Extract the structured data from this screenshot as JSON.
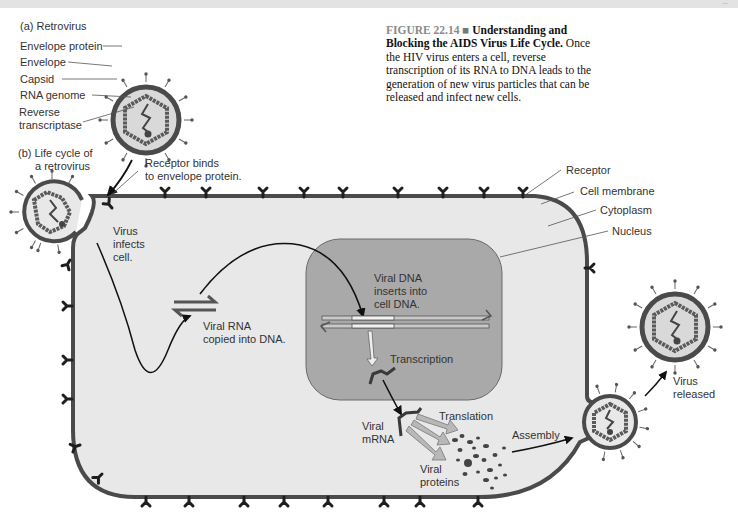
{
  "page": {
    "page_number": "..."
  },
  "caption": {
    "figure_number": "FIGURE 22.14",
    "separator": "■",
    "title": "Understanding and Blocking the AIDS Virus Life Cycle.",
    "body": "Once the HIV virus enters a cell, reverse transcription of its RNA to DNA leads to the generation of new virus particles that can be released and infect new cells."
  },
  "panel_a": {
    "heading": "(a) Retrovirus",
    "labels": [
      "Envelope protein",
      "Envelope",
      "Capsid",
      "RNA genome",
      "Reverse",
      "transcriptase"
    ]
  },
  "panel_b": {
    "heading_line1": "(b) Life cycle of",
    "heading_line2": "a retrovirus",
    "labels": {
      "receptor_binds_1": "Receptor binds",
      "receptor_binds_2": "to envelope protein.",
      "receptor": "Receptor",
      "cell_membrane": "Cell membrane",
      "cytoplasm": "Cytoplasm",
      "nucleus": "Nucleus",
      "virus_infects_1": "Virus",
      "virus_infects_2": "infects",
      "virus_infects_3": "cell.",
      "rna_copied_1": "Viral RNA",
      "rna_copied_2": "copied into DNA.",
      "dna_inserts_1": "Viral DNA",
      "dna_inserts_2": "inserts into",
      "dna_inserts_3": "cell DNA.",
      "transcription": "Transcription",
      "viral_mrna_1": "Viral",
      "viral_mrna_2": "mRNA",
      "translation": "Translation",
      "viral_proteins_1": "Viral",
      "viral_proteins_2": "proteins",
      "assembly": "Assembly",
      "virus_released_1": "Virus",
      "virus_released_2": "released"
    }
  },
  "colors": {
    "cytoplasm": "#e8e8e8",
    "membrane": "#4a4a4a",
    "nucleus": "#a9a9a9",
    "receptor": "#1e1e1e",
    "capsid": "#5a5a5a",
    "arrow_fill": "#b8b8b8"
  }
}
